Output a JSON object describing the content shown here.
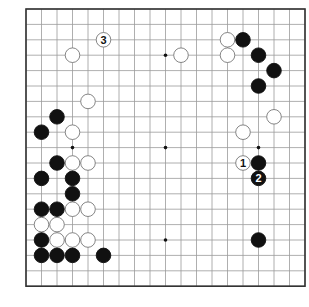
{
  "board": {
    "size": 19,
    "origin_x": 26,
    "origin_y": 9,
    "spacing_x": 15.5,
    "spacing_y": 15.4,
    "stone_radius": 7.3,
    "line_color": "#9a9a9a",
    "border_color": "#333333",
    "star_points": [
      [
        3,
        3
      ],
      [
        9,
        3
      ],
      [
        15,
        3
      ],
      [
        3,
        9
      ],
      [
        9,
        9
      ],
      [
        15,
        9
      ],
      [
        3,
        15
      ],
      [
        9,
        15
      ],
      [
        15,
        15
      ]
    ]
  },
  "stones": [
    {
      "color": "white",
      "col": 3,
      "row": 3
    },
    {
      "color": "white",
      "col": 4,
      "row": 6
    },
    {
      "color": "black",
      "col": 2,
      "row": 7
    },
    {
      "color": "black",
      "col": 1,
      "row": 8
    },
    {
      "color": "white",
      "col": 3,
      "row": 8
    },
    {
      "color": "white",
      "col": 13,
      "row": 2
    },
    {
      "color": "black",
      "col": 14,
      "row": 2
    },
    {
      "color": "white",
      "col": 10,
      "row": 3
    },
    {
      "color": "white",
      "col": 13,
      "row": 3
    },
    {
      "color": "black",
      "col": 15,
      "row": 3
    },
    {
      "color": "black",
      "col": 16,
      "row": 4
    },
    {
      "color": "black",
      "col": 15,
      "row": 5
    },
    {
      "color": "white",
      "col": 16,
      "row": 7
    },
    {
      "color": "white",
      "col": 14,
      "row": 8
    },
    {
      "color": "black",
      "col": 2,
      "row": 10
    },
    {
      "color": "white",
      "col": 3,
      "row": 10
    },
    {
      "color": "white",
      "col": 4,
      "row": 10
    },
    {
      "color": "black",
      "col": 1,
      "row": 11
    },
    {
      "color": "black",
      "col": 3,
      "row": 11
    },
    {
      "color": "black",
      "col": 3,
      "row": 12
    },
    {
      "color": "black",
      "col": 1,
      "row": 13
    },
    {
      "color": "black",
      "col": 2,
      "row": 13
    },
    {
      "color": "white",
      "col": 3,
      "row": 13
    },
    {
      "color": "white",
      "col": 4,
      "row": 13
    },
    {
      "color": "white",
      "col": 1,
      "row": 14
    },
    {
      "color": "white",
      "col": 2,
      "row": 14
    },
    {
      "color": "black",
      "col": 1,
      "row": 15
    },
    {
      "color": "white",
      "col": 2,
      "row": 15
    },
    {
      "color": "white",
      "col": 3,
      "row": 15
    },
    {
      "color": "white",
      "col": 4,
      "row": 15
    },
    {
      "color": "black",
      "col": 1,
      "row": 16
    },
    {
      "color": "black",
      "col": 2,
      "row": 16
    },
    {
      "color": "black",
      "col": 3,
      "row": 16
    },
    {
      "color": "black",
      "col": 5,
      "row": 16
    },
    {
      "color": "black",
      "col": 15,
      "row": 10
    },
    {
      "color": "black",
      "col": 15,
      "row": 15
    }
  ],
  "moves": [
    {
      "number": "1",
      "color": "white",
      "col": 14,
      "row": 10
    },
    {
      "number": "2",
      "color": "black",
      "col": 15,
      "row": 11
    },
    {
      "number": "3",
      "color": "white",
      "col": 5,
      "row": 2
    }
  ]
}
